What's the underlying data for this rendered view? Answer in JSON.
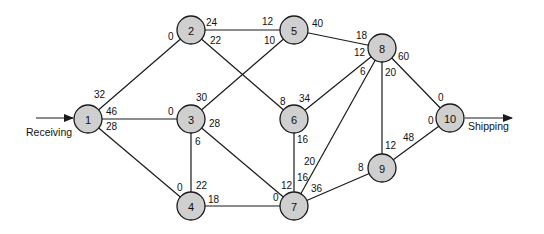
{
  "diagram": {
    "type": "network-flow",
    "colors": {
      "node_fill": "#cfcfcf",
      "stroke": "#1a1a1a"
    },
    "io": {
      "source_label": "Receiving",
      "sink_label": "Shipping"
    },
    "nodes": [
      {
        "id": "1",
        "label": "1",
        "x": 88,
        "y": 119
      },
      {
        "id": "2",
        "label": "2",
        "x": 191,
        "y": 30
      },
      {
        "id": "3",
        "label": "3",
        "x": 191,
        "y": 119
      },
      {
        "id": "4",
        "label": "4",
        "x": 191,
        "y": 206
      },
      {
        "id": "5",
        "label": "5",
        "x": 294,
        "y": 30
      },
      {
        "id": "6",
        "label": "6",
        "x": 294,
        "y": 119
      },
      {
        "id": "7",
        "label": "7",
        "x": 294,
        "y": 206
      },
      {
        "id": "8",
        "label": "8",
        "x": 382,
        "y": 48
      },
      {
        "id": "9",
        "label": "9",
        "x": 382,
        "y": 168
      },
      {
        "id": "10",
        "label": "10",
        "x": 450,
        "y": 118
      }
    ],
    "edges": [
      {
        "from": "1",
        "to": "2",
        "from_cap": "32",
        "to_cap": "0"
      },
      {
        "from": "1",
        "to": "3",
        "from_cap": "46",
        "to_cap": "0"
      },
      {
        "from": "1",
        "to": "4",
        "from_cap": "28",
        "to_cap": "0"
      },
      {
        "from": "2",
        "to": "5",
        "from_cap": "24",
        "to_cap": "12"
      },
      {
        "from": "2",
        "to": "6",
        "from_cap": "22",
        "to_cap": "8"
      },
      {
        "from": "3",
        "to": "5",
        "from_cap": "30",
        "to_cap": "10"
      },
      {
        "from": "3",
        "to": "4",
        "from_cap": "6",
        "to_cap": "22"
      },
      {
        "from": "3",
        "to": "7",
        "from_cap": "28",
        "to_cap": "12"
      },
      {
        "from": "4",
        "to": "7",
        "from_cap": "18",
        "to_cap": "0"
      },
      {
        "from": "5",
        "to": "8",
        "from_cap": "40",
        "to_cap": "18"
      },
      {
        "from": "6",
        "to": "8",
        "from_cap": "34",
        "to_cap": "12"
      },
      {
        "from": "6",
        "to": "7",
        "from_cap": "16",
        "to_cap": "16"
      },
      {
        "from": "7",
        "to": "8",
        "from_cap": "20",
        "to_cap": "6"
      },
      {
        "from": "7",
        "to": "9",
        "from_cap": "36",
        "to_cap": "8"
      },
      {
        "from": "8",
        "to": "9",
        "from_cap": "20",
        "to_cap": "12"
      },
      {
        "from": "8",
        "to": "10",
        "from_cap": "60",
        "to_cap": "0"
      },
      {
        "from": "9",
        "to": "10",
        "from_cap": "48",
        "to_cap": "0"
      }
    ],
    "labels": [
      {
        "text": "32",
        "x": 94,
        "y": 98
      },
      {
        "text": "46",
        "x": 106,
        "y": 115
      },
      {
        "text": "28",
        "x": 106,
        "y": 130
      },
      {
        "text": "0",
        "x": 168,
        "y": 40
      },
      {
        "text": "24",
        "x": 206,
        "y": 26
      },
      {
        "text": "22",
        "x": 210,
        "y": 44
      },
      {
        "text": "0",
        "x": 168,
        "y": 115
      },
      {
        "text": "30",
        "x": 196,
        "y": 101
      },
      {
        "text": "28",
        "x": 209,
        "y": 127
      },
      {
        "text": "6",
        "x": 195,
        "y": 145
      },
      {
        "text": "0",
        "x": 177,
        "y": 191
      },
      {
        "text": "22",
        "x": 196,
        "y": 189
      },
      {
        "text": "18",
        "x": 208,
        "y": 203
      },
      {
        "text": "12",
        "x": 262,
        "y": 25
      },
      {
        "text": "10",
        "x": 264,
        "y": 44
      },
      {
        "text": "40",
        "x": 312,
        "y": 27
      },
      {
        "text": "8",
        "x": 280,
        "y": 105
      },
      {
        "text": "34",
        "x": 299,
        "y": 102
      },
      {
        "text": "16",
        "x": 297,
        "y": 143
      },
      {
        "text": "0",
        "x": 273,
        "y": 201
      },
      {
        "text": "12",
        "x": 281,
        "y": 189
      },
      {
        "text": "16",
        "x": 297,
        "y": 181
      },
      {
        "text": "20",
        "x": 304,
        "y": 165
      },
      {
        "text": "36",
        "x": 311,
        "y": 192
      },
      {
        "text": "18",
        "x": 356,
        "y": 39
      },
      {
        "text": "12",
        "x": 354,
        "y": 56
      },
      {
        "text": "6",
        "x": 360,
        "y": 75
      },
      {
        "text": "20",
        "x": 385,
        "y": 76
      },
      {
        "text": "60",
        "x": 398,
        "y": 60
      },
      {
        "text": "8",
        "x": 358,
        "y": 171
      },
      {
        "text": "12",
        "x": 385,
        "y": 149
      },
      {
        "text": "48",
        "x": 403,
        "y": 141
      },
      {
        "text": "0",
        "x": 438,
        "y": 101
      },
      {
        "text": "0",
        "x": 428,
        "y": 124
      }
    ]
  }
}
